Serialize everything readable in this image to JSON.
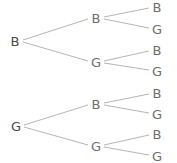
{
  "colors": {
    "line": "#b5b5b5",
    "label": "#6e6e6e",
    "root": "#4a4a4a"
  },
  "nodes": [
    {
      "id": "r1",
      "label": "B",
      "x": 15,
      "y": 41,
      "level": 0
    },
    {
      "id": "r1b",
      "label": "B",
      "x": 96,
      "y": 18,
      "level": 1
    },
    {
      "id": "r1g",
      "label": "G",
      "x": 96,
      "y": 62,
      "level": 1
    },
    {
      "id": "r1bb",
      "label": "B",
      "x": 157,
      "y": 7,
      "level": 2
    },
    {
      "id": "r1bg",
      "label": "G",
      "x": 157,
      "y": 29,
      "level": 2
    },
    {
      "id": "r1gb",
      "label": "B",
      "x": 157,
      "y": 50,
      "level": 2
    },
    {
      "id": "r1gg",
      "label": "G",
      "x": 157,
      "y": 71,
      "level": 2
    },
    {
      "id": "r2",
      "label": "G",
      "x": 16,
      "y": 126,
      "level": 0
    },
    {
      "id": "r2b",
      "label": "B",
      "x": 96,
      "y": 104,
      "level": 1
    },
    {
      "id": "r2g",
      "label": "G",
      "x": 96,
      "y": 146,
      "level": 1
    },
    {
      "id": "r2bb",
      "label": "B",
      "x": 157,
      "y": 93,
      "level": 2
    },
    {
      "id": "r2bg",
      "label": "G",
      "x": 157,
      "y": 114,
      "level": 2
    },
    {
      "id": "r2gb",
      "label": "B",
      "x": 157,
      "y": 134,
      "level": 2
    },
    {
      "id": "r2gg",
      "label": "G",
      "x": 157,
      "y": 156,
      "level": 2
    }
  ],
  "edges": [
    [
      "r1",
      "r1b"
    ],
    [
      "r1",
      "r1g"
    ],
    [
      "r1b",
      "r1bb"
    ],
    [
      "r1b",
      "r1bg"
    ],
    [
      "r1g",
      "r1gb"
    ],
    [
      "r1g",
      "r1gg"
    ],
    [
      "r2",
      "r2b"
    ],
    [
      "r2",
      "r2g"
    ],
    [
      "r2b",
      "r2bb"
    ],
    [
      "r2b",
      "r2bg"
    ],
    [
      "r2g",
      "r2gb"
    ],
    [
      "r2g",
      "r2gg"
    ]
  ]
}
